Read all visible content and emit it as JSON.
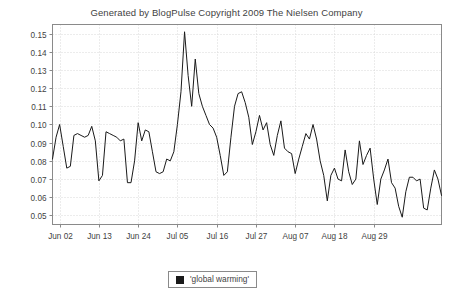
{
  "chart_data": {
    "type": "line",
    "title": "Generated by BlogPulse Copyright 2009 The Nielsen Company",
    "xlabel": "Date",
    "ylabel": "Percent of All Blog Posts",
    "grid": true,
    "legend_position": "bottom-center",
    "ylim": [
      0.045,
      0.155
    ],
    "yticks": [
      0.05,
      0.06,
      0.07,
      0.08,
      0.09,
      0.1,
      0.11,
      0.12,
      0.13,
      0.14,
      0.15
    ],
    "ytick_labels": [
      "0.05",
      "0.06",
      "0.07",
      "0.08",
      "0.09",
      "0.10",
      "0.11",
      "0.12",
      "0.13",
      "0.14",
      "0.15"
    ],
    "xtick_labels": [
      "Jun 02",
      "Jun 13",
      "Jun 24",
      "Jul 05",
      "Jul 16",
      "Jul 27",
      "Aug 07",
      "Aug 18",
      "Aug 29"
    ],
    "xtick_indices": [
      2,
      13,
      24,
      35,
      46,
      57,
      68,
      79,
      90
    ],
    "x_start_label": "May 31",
    "x_end_label": "Sep 02",
    "series": [
      {
        "name": "'global warming'",
        "color": "#1a1a1a",
        "values": [
          0.081,
          0.093,
          0.1,
          0.088,
          0.076,
          0.077,
          0.094,
          0.095,
          0.094,
          0.093,
          0.094,
          0.099,
          0.091,
          0.069,
          0.072,
          0.096,
          0.095,
          0.094,
          0.093,
          0.091,
          0.092,
          0.068,
          0.068,
          0.08,
          0.101,
          0.091,
          0.097,
          0.096,
          0.085,
          0.074,
          0.073,
          0.074,
          0.081,
          0.08,
          0.085,
          0.1,
          0.118,
          0.151,
          0.127,
          0.11,
          0.136,
          0.117,
          0.11,
          0.105,
          0.1,
          0.098,
          0.093,
          0.083,
          0.072,
          0.074,
          0.093,
          0.11,
          0.117,
          0.118,
          0.112,
          0.104,
          0.089,
          0.096,
          0.105,
          0.097,
          0.101,
          0.089,
          0.083,
          0.094,
          0.102,
          0.087,
          0.085,
          0.084,
          0.073,
          0.081,
          0.088,
          0.095,
          0.092,
          0.1,
          0.092,
          0.08,
          0.072,
          0.058,
          0.072,
          0.076,
          0.07,
          0.069,
          0.086,
          0.074,
          0.067,
          0.07,
          0.091,
          0.078,
          0.083,
          0.087,
          0.07,
          0.056,
          0.07,
          0.075,
          0.081,
          0.068,
          0.065,
          0.055,
          0.049,
          0.063,
          0.071,
          0.071,
          0.069,
          0.07,
          0.054,
          0.053,
          0.065,
          0.075,
          0.07,
          0.061
        ]
      }
    ]
  },
  "legend": {
    "entries": [
      {
        "label": "'global warming'",
        "swatch_color": "#1a1a1a",
        "swatch_icon": "square-marker-icon"
      }
    ]
  },
  "colors": {
    "line": "#1a1a1a",
    "frame": "#8a8a8a",
    "grid": "#d9d9d9",
    "text": "#3f3f3f",
    "background": "#ffffff"
  }
}
